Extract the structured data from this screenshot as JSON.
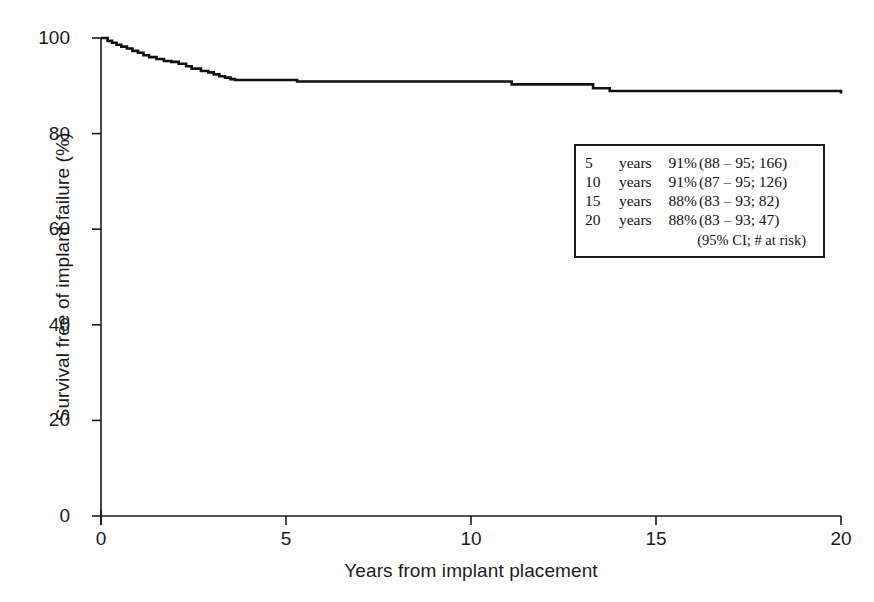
{
  "chart_data": {
    "type": "line",
    "title": "",
    "xlabel": "Years from implant placement",
    "ylabel": "Survival free of implant failure (%)",
    "xlim": [
      0,
      20
    ],
    "ylim": [
      0,
      100
    ],
    "xticks": [
      0,
      5,
      10,
      15,
      20
    ],
    "yticks": [
      0,
      20,
      40,
      60,
      80,
      100
    ],
    "xtick_labels": [
      "0",
      "5",
      "10",
      "15",
      "20"
    ],
    "ytick_labels": [
      "0",
      "20",
      "40",
      "60",
      "80",
      "100"
    ],
    "grid": false,
    "legend_position": "inside-upper-right",
    "curve_style": "kaplan-meier-step",
    "series": [
      {
        "name": "Survival free of implant failure",
        "x": [
          0,
          0.18,
          0.3,
          0.42,
          0.55,
          0.7,
          0.85,
          1.0,
          1.15,
          1.3,
          1.5,
          1.7,
          1.9,
          2.1,
          2.3,
          2.45,
          2.7,
          2.9,
          3.05,
          3.2,
          3.35,
          3.5,
          3.62,
          5.3,
          11.1,
          13.3,
          13.75,
          20
        ],
        "y": [
          100,
          99.4,
          99.0,
          98.6,
          98.2,
          97.8,
          97.3,
          96.9,
          96.4,
          96.0,
          95.6,
          95.2,
          95.0,
          94.6,
          94.1,
          93.6,
          93.1,
          92.8,
          92.4,
          92.0,
          91.7,
          91.4,
          91.2,
          90.9,
          90.3,
          89.5,
          88.9,
          88.4
        ],
        "color": "#111111"
      }
    ],
    "annotations": {
      "survival_table": [
        {
          "time": "5",
          "unit": "years",
          "survival": "91%",
          "ci_and_risk": "(88 – 95; 166)"
        },
        {
          "time": "10",
          "unit": "years",
          "survival": "91%",
          "ci_and_risk": "(87 – 95; 126)"
        },
        {
          "time": "15",
          "unit": "years",
          "survival": "88%",
          "ci_and_risk": "(83 – 93; 82)"
        },
        {
          "time": "20",
          "unit": "years",
          "survival": "88%",
          "ci_and_risk": "(83 – 93; 47)"
        }
      ],
      "footnote": "(95% CI; # at risk)"
    }
  },
  "colors": {
    "curve": "#111111",
    "axis": "#1a1a1a",
    "text": "#1c1c1c",
    "background": "#ffffff"
  }
}
